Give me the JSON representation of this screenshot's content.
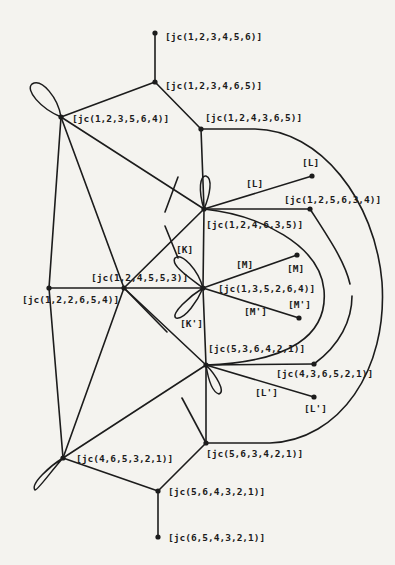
{
  "diagram": {
    "type": "graph",
    "style": "hand-drawn line diagram",
    "nodes": [
      {
        "id": "n1",
        "label": "[jc(1,2,3,4,5,6)]",
        "x": 155,
        "y": 33,
        "lx": 165,
        "ly": 40
      },
      {
        "id": "n2",
        "label": "[jc(1,2,3,4,6,5)]",
        "x": 155,
        "y": 82,
        "lx": 165,
        "ly": 89
      },
      {
        "id": "n3",
        "label": "[jc(1,2,3,5,6,4)]",
        "x": 61,
        "y": 117,
        "lx": 72,
        "ly": 122
      },
      {
        "id": "n4",
        "label": "[jc(1,2,4,3,6,5)]",
        "x": 201,
        "y": 129,
        "lx": 205,
        "ly": 121
      },
      {
        "id": "n5",
        "label": "[jc(1,2,4,6,3,5)]",
        "x": 204,
        "y": 209,
        "lx": 206,
        "ly": 228
      },
      {
        "id": "n6",
        "label": "[L]",
        "x": 312,
        "y": 176,
        "lx": 302,
        "ly": 166
      },
      {
        "id": "n7",
        "label": "[jc(1,2,5,6,3,4)]",
        "x": 310,
        "y": 209,
        "lx": 284,
        "ly": 203
      },
      {
        "id": "n8",
        "label": "[jc(1,2,4,5,5,3)]",
        "x": 124,
        "y": 288,
        "lx": 91,
        "ly": 281
      },
      {
        "id": "n9",
        "label": "[jc(1,2,2,6,5,4)]",
        "x": 49,
        "y": 288,
        "lx": 22,
        "ly": 303
      },
      {
        "id": "n10",
        "label": "[jc(1,3,5,2,6,4)]",
        "x": 203,
        "y": 288,
        "lx": 218,
        "ly": 292
      },
      {
        "id": "n11",
        "label": "[M]",
        "x": 297,
        "y": 255,
        "lx": 287,
        "ly": 272
      },
      {
        "id": "n12",
        "label": "[M']",
        "x": 299,
        "y": 318,
        "lx": 288,
        "ly": 308
      },
      {
        "id": "n13",
        "label": "[jc(5,3,6,4,2,1)]",
        "x": 206,
        "y": 365,
        "lx": 208,
        "ly": 352
      },
      {
        "id": "n14",
        "label": "[jc(4,3,6,5,2,1)]",
        "x": 314,
        "y": 364,
        "lx": 276,
        "ly": 377
      },
      {
        "id": "n15",
        "label": "[L']",
        "x": 314,
        "y": 397,
        "lx": 304,
        "ly": 412
      },
      {
        "id": "n16",
        "label": "[jc(4,6,5,3,2,1)]",
        "x": 63,
        "y": 458,
        "lx": 76,
        "ly": 462
      },
      {
        "id": "n17",
        "label": "[jc(5,6,3,4,2,1)]",
        "x": 206,
        "y": 443,
        "lx": 206,
        "ly": 457
      },
      {
        "id": "n18",
        "label": "[jc(5,6,4,3,2,1)]",
        "x": 158,
        "y": 491,
        "lx": 168,
        "ly": 495
      },
      {
        "id": "n19",
        "label": "[jc(6,5,4,3,2,1)]",
        "x": 158,
        "y": 537,
        "lx": 168,
        "ly": 541
      }
    ],
    "edge_labels": [
      {
        "id": "e_L",
        "label": "[L]",
        "lx": 246,
        "ly": 187
      },
      {
        "id": "e_K",
        "label": "[K]",
        "lx": 176,
        "ly": 253
      },
      {
        "id": "e_Kp",
        "label": "[K']",
        "lx": 180,
        "ly": 327
      },
      {
        "id": "e_MM",
        "label": "[M]",
        "lx": 236,
        "ly": 268
      },
      {
        "id": "e_MMp",
        "label": "[M']",
        "lx": 244,
        "ly": 315
      },
      {
        "id": "e_Lp",
        "label": "[L']",
        "lx": 255,
        "ly": 396
      }
    ],
    "straight_edges": [
      [
        "n1",
        "n2"
      ],
      [
        "n2",
        "n3"
      ],
      [
        "n2",
        "n4"
      ],
      [
        "n4",
        "n5"
      ],
      [
        "n3",
        "n5"
      ],
      [
        "n3",
        "n8"
      ],
      [
        "n3",
        "n9"
      ],
      [
        "n5",
        "n6"
      ],
      [
        "n5",
        "n7"
      ],
      [
        "n5",
        "n8"
      ],
      [
        "n9",
        "n8"
      ],
      [
        "n8",
        "n10"
      ],
      [
        "n10",
        "n5"
      ],
      [
        "n10",
        "n13"
      ],
      [
        "n10",
        "n11"
      ],
      [
        "n10",
        "n12"
      ],
      [
        "n9",
        "n16"
      ],
      [
        "n8",
        "n16"
      ],
      [
        "n8",
        "n13"
      ],
      [
        "n16",
        "n13"
      ],
      [
        "n13",
        "n14"
      ],
      [
        "n13",
        "n15"
      ],
      [
        "n13",
        "n17"
      ],
      [
        "n16",
        "n18"
      ],
      [
        "n17",
        "n18"
      ],
      [
        "n18",
        "n19"
      ]
    ],
    "stub_edges": [
      [
        178,
        177,
        165,
        212
      ],
      [
        178,
        258,
        165,
        226
      ],
      [
        124,
        288,
        167,
        332
      ],
      [
        182,
        398,
        206,
        443
      ]
    ]
  }
}
